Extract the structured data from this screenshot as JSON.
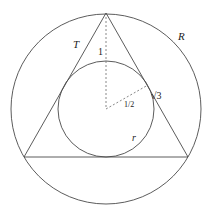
{
  "figure": {
    "colors": {
      "stroke": "#4a4a4a",
      "dashed": "#6a6a6a",
      "background": "#ffffff"
    },
    "labels": {
      "triangle": "T",
      "circumcircle": "R",
      "incircle": "r",
      "apex_to_incircle": "1",
      "inradius": "1/2",
      "side_segment": "√3"
    }
  }
}
